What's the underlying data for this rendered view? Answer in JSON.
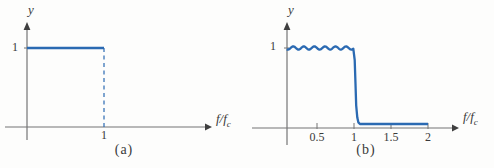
{
  "figure_style": {
    "background": "#fdfdfc",
    "curve_color": "#2b6ab2",
    "axis_color": "#757575",
    "arrow_color": "#3f3f3f",
    "text_color": "#3a3a3a"
  },
  "chart_data": [
    {
      "type": "line",
      "panel": "(a)",
      "title": "Ideal low-pass filter frequency response",
      "xlabel": "f/f_c",
      "xlabel_main": "f/f",
      "xlabel_sub": "c",
      "ylabel": "y",
      "x_range": [
        0,
        2.3
      ],
      "y_range": [
        0,
        1.35
      ],
      "grid": false,
      "x_ticks": [
        {
          "value": 1,
          "label": "1"
        }
      ],
      "y_ticks": [
        {
          "value": 1,
          "label": "1"
        }
      ],
      "series": [
        {
          "name": "passband",
          "style": "solid",
          "x": [
            0,
            1
          ],
          "y": [
            1,
            1
          ]
        },
        {
          "name": "cutoff",
          "style": "dashed",
          "x": [
            1,
            1
          ],
          "y": [
            1,
            0
          ]
        }
      ]
    },
    {
      "type": "line",
      "panel": "(b)",
      "title": "Practical low-pass filter frequency response",
      "xlabel": "f/f_c",
      "xlabel_main": "f/f",
      "xlabel_sub": "c",
      "ylabel": "y",
      "x_range": [
        0,
        2.35
      ],
      "y_range": [
        0,
        1.35
      ],
      "grid": false,
      "x_ticks": [
        {
          "value": 0.5,
          "label": "0.5"
        },
        {
          "value": 1,
          "label": "1"
        },
        {
          "value": 1.5,
          "label": "1.5"
        },
        {
          "value": 2,
          "label": "2"
        }
      ],
      "y_ticks": [
        {
          "value": 1,
          "label": "1"
        }
      ],
      "series": [
        {
          "name": "practical response",
          "style": "solid",
          "ripple": {
            "level": 1,
            "amplitude": 0.02,
            "cycles": 7,
            "x_start": 0.09,
            "x_end": 1.0
          },
          "transition": [
            [
              1.01,
              0.85
            ],
            [
              1.02,
              0.55
            ],
            [
              1.03,
              0.28
            ],
            [
              1.045,
              0.13
            ],
            [
              1.06,
              0.07
            ],
            [
              1.08,
              0.05
            ]
          ],
          "stopband": {
            "y": 0.05,
            "x_end": 2.0
          }
        }
      ]
    }
  ]
}
